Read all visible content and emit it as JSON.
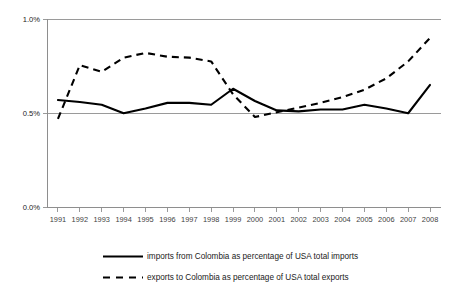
{
  "chart_data": {
    "type": "line",
    "title": "",
    "xlabel": "",
    "ylabel": "",
    "grid": true,
    "legend_position": "bottom",
    "ylim": [
      0,
      1.0
    ],
    "ytick_labels": [
      "0.0%",
      "0.5%",
      "1.0%"
    ],
    "ytick_values": [
      0,
      0.5,
      1.0
    ],
    "categories": [
      "1991",
      "1992",
      "1993",
      "1994",
      "1995",
      "1996",
      "1997",
      "1998",
      "1999",
      "2000",
      "2001",
      "2002",
      "2003",
      "2004",
      "2005",
      "2006",
      "2007",
      "2008"
    ],
    "series": [
      {
        "name": "imports from Colombia as percentage of USA total imports",
        "style": "solid",
        "values": [
          0.57,
          0.56,
          0.545,
          0.5,
          0.525,
          0.555,
          0.555,
          0.545,
          0.63,
          0.565,
          0.515,
          0.51,
          0.52,
          0.52,
          0.545,
          0.525,
          0.5,
          0.65
        ]
      },
      {
        "name": "exports to Colombia as percentage of USA total exports",
        "style": "dashed",
        "values": [
          0.47,
          0.755,
          0.72,
          0.795,
          0.82,
          0.8,
          0.795,
          0.775,
          0.6,
          0.48,
          0.505,
          0.53,
          0.555,
          0.585,
          0.625,
          0.685,
          0.775,
          0.9
        ]
      }
    ]
  },
  "legend": {
    "entries": [
      {
        "label": "imports from Colombia as percentage of USA total imports",
        "style": "solid"
      },
      {
        "label": "exports to Colombia as percentage of USA total exports",
        "style": "dashed"
      }
    ]
  },
  "colors": {
    "series_line": "#000000",
    "grid": "#9a9a9a",
    "axis": "#8e8e8e",
    "tick_text": "#3f3f3f",
    "background": "#ffffff"
  }
}
